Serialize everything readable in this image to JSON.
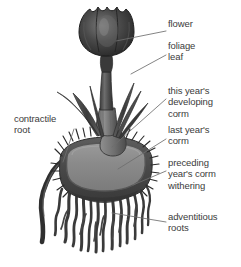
{
  "diagram": {
    "background_color": "#ffffff",
    "text_color": "#3b3b3b",
    "leader_line_color": "#6e6e6e"
  },
  "labels": [
    {
      "id": "flower",
      "text": "flower",
      "x": 168,
      "y": 23,
      "side": "right",
      "leader": {
        "x1": 166,
        "y1": 31,
        "x2": 116,
        "y2": 41
      }
    },
    {
      "id": "foliage-leaf",
      "text": "foliage\nleaf",
      "x": 168,
      "y": 45,
      "side": "right",
      "leader": {
        "x1": 166,
        "y1": 55,
        "x2": 131,
        "y2": 74
      }
    },
    {
      "id": "this-years-developing-corm",
      "text": "this year's\ndeveloping\ncorm",
      "x": 168,
      "y": 90,
      "side": "right",
      "leader": {
        "x1": 166,
        "y1": 99,
        "x2": 112,
        "y2": 147
      }
    },
    {
      "id": "last-years-corm",
      "text": "last year's\ncorm",
      "x": 168,
      "y": 129,
      "side": "right",
      "leader": {
        "x1": 166,
        "y1": 139,
        "x2": 118,
        "y2": 169
      }
    },
    {
      "id": "preceding-years-corm-withering",
      "text": "preceding\nyear's corm\nwithering",
      "x": 168,
      "y": 162,
      "side": "right",
      "leader": {
        "x1": 166,
        "y1": 171,
        "x2": 133,
        "y2": 185
      }
    },
    {
      "id": "adventitious-roots",
      "text": "adventitious\nroots",
      "x": 168,
      "y": 216,
      "side": "right",
      "leader": {
        "x1": 166,
        "y1": 222,
        "x2": 112,
        "y2": 213
      }
    },
    {
      "id": "contractile-root",
      "text": "contractile\nroot",
      "x": 14,
      "y": 118,
      "side": "left",
      "leader": {
        "x1": 74,
        "y1": 129,
        "x2": 63,
        "y2": 162
      }
    }
  ],
  "plant_parts": [
    {
      "id": "flower-bloom",
      "name": "flower",
      "color": "#3a3a3a"
    },
    {
      "id": "flower-stem",
      "name": "stem",
      "color": "#555555"
    },
    {
      "id": "foliage-leaves",
      "name": "foliage leaves",
      "color": "#4a4a4a"
    },
    {
      "id": "developing-corm",
      "name": "this year's developing corm",
      "color": "#6f6f6f"
    },
    {
      "id": "main-corm",
      "name": "last year's corm",
      "color": "#8a8a8a"
    },
    {
      "id": "corm-tunic",
      "name": "corm tunic / withering corm",
      "color": "#4f4f4f"
    },
    {
      "id": "adventitious-roots",
      "name": "adventitious roots",
      "color": "#3f3f3f"
    },
    {
      "id": "contractile-root",
      "name": "contractile root",
      "color": "#3a3a3a"
    }
  ]
}
